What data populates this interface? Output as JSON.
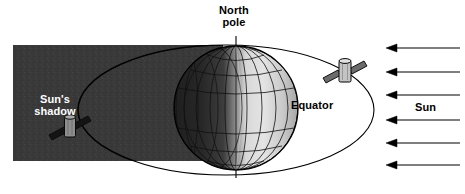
{
  "diagram": {
    "labels": {
      "north_pole": "North\npole",
      "sun_shadow": "Sun's\nshadow",
      "equator": "Equator",
      "sun": "Sun"
    },
    "colors": {
      "shadow_fill": "#3a3a3a",
      "globe_night": "#2e2e2e",
      "globe_day": "#dcdcdc",
      "globe_mid": "#9a9a9a",
      "line": "#000000",
      "satellite_body": "#b8b8b8",
      "satellite_panel": "#5a5a5a",
      "background": "#ffffff"
    },
    "elements": {
      "shadow_band": {
        "name": "sun-shadow-band",
        "x": 13,
        "y": 45,
        "width": 210,
        "height": 116
      },
      "orbit": {
        "name": "satellite-orbit-ellipse",
        "cx": 226,
        "cy": 110,
        "rx": 148,
        "ry": 65
      },
      "globe": {
        "name": "earth-globe",
        "cx": 236,
        "cy": 108,
        "r": 62,
        "meridians": 12,
        "parallels": 7
      },
      "axis": {
        "name": "earth-axis-line",
        "x": 236,
        "y_top": 36,
        "y_bottom": 178
      },
      "satellites": [
        {
          "name": "satellite-sunlit",
          "x": 345,
          "y": 72,
          "in_shadow": false
        },
        {
          "name": "satellite-in-shadow",
          "x": 70,
          "y": 128,
          "in_shadow": true
        }
      ],
      "sun_rays": {
        "name": "sun-ray-arrows",
        "count": 6,
        "direction": "left",
        "x_start": 460,
        "x_end": 386,
        "y_positions": [
          48,
          72,
          95,
          120,
          143,
          165
        ]
      }
    }
  }
}
